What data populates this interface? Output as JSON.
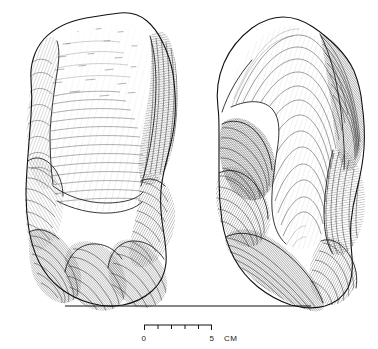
{
  "figure": {
    "kind": "archaeological-line-drawing",
    "medium": "pen-and-ink stipple and hatch illustration",
    "background_color": "#ffffff",
    "ink_color": "#1a1a1a",
    "views": [
      {
        "id": "left-view",
        "label": "",
        "position": "left",
        "description": "dorsal face with large broad flake scar and cortical ridge on right margin"
      },
      {
        "id": "right-view",
        "label": "",
        "position": "right",
        "description": "ventral face with sweeping concentric flake scar ripples"
      }
    ]
  },
  "ground_line": {
    "name": "baseline",
    "x_start": 65,
    "x_end": 311,
    "y": 306
  },
  "scale_bar": {
    "units": "CM",
    "min_label": "0",
    "max_label": "5",
    "unit_label": "CM",
    "divisions": 5,
    "x_start": 144,
    "x_end": 212,
    "y": 325,
    "tick_height": 5,
    "labels": [
      "0",
      "5",
      "CM"
    ]
  },
  "colors": {
    "ink": "#1a1a1a",
    "hatch": "#2b2b2b",
    "light_hatch": "#5a5a5a",
    "paper": "#ffffff"
  }
}
